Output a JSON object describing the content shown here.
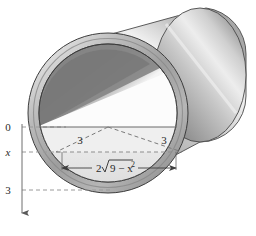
{
  "figure": {
    "name": "cylindrical-tube-cross-section-diagram",
    "type": "geometry-diagram",
    "colors": {
      "outline": "#3a3a3a",
      "axis": "#6e6e6e",
      "dashed_guide": "#9a9a9a",
      "metal_light": "#f2f2f2",
      "metal_mid": "#b8b8b8",
      "metal_dark": "#7c7c7c",
      "metal_darkest": "#5d5d5d",
      "interior_white": "#fbfbfb",
      "interior_shadow": "#8f8f8f",
      "label_text": "#2a2a2a"
    }
  },
  "axis": {
    "name": "vertical-x-axis",
    "direction": "downward",
    "ticks": [
      {
        "label": "0",
        "value": 0,
        "y_px": 127
      },
      {
        "label": "x",
        "value": "x",
        "y_px": 152,
        "italic": true
      },
      {
        "label": "3",
        "value": 3,
        "y_px": 190
      }
    ],
    "arrowhead": "down"
  },
  "labels": {
    "radius_left": "3",
    "radius_right": "3",
    "chord_prefix": "2",
    "chord_radical_body": "9 − x",
    "chord_exponent": "2",
    "chord_full": "2√(9 − x²)"
  },
  "guides": [
    {
      "name": "guide-line-0",
      "label": "0",
      "style": "dashed"
    },
    {
      "name": "guide-line-x",
      "label": "x",
      "style": "dashed"
    },
    {
      "name": "guide-line-3",
      "label": "3",
      "style": "dashed"
    }
  ],
  "geometry": {
    "triangle": {
      "apex_label": "center",
      "legs": [
        "3",
        "3"
      ],
      "base_label": "2√(9 − x²)"
    },
    "chord_dimension": {
      "arrows": "double-headed",
      "label": "2√(9 − x²)"
    }
  }
}
